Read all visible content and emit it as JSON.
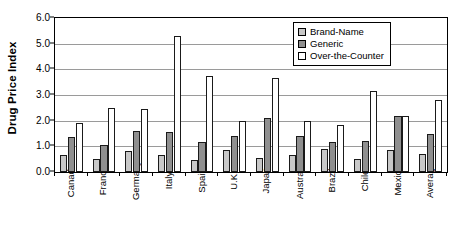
{
  "chart_data": {
    "type": "bar",
    "title": "",
    "xlabel": "",
    "ylabel": "Drug Price Index",
    "ylim": [
      0.0,
      6.0
    ],
    "ytick_labels": [
      "0.0",
      "1.0",
      "2.0",
      "3.0",
      "4.0",
      "5.0",
      "6.0"
    ],
    "ytick_values": [
      0.0,
      1.0,
      2.0,
      3.0,
      4.0,
      5.0,
      6.0
    ],
    "grid": true,
    "legend_position": "top-right",
    "categories": [
      "Canada",
      "France",
      "Germany",
      "Italy",
      "Spain",
      "U.K.",
      "Japan",
      "Australia",
      "Brazil",
      "Chile",
      "Mexico",
      "Average"
    ],
    "series": [
      {
        "name": "Brand-Name",
        "color": "#c8c8c8",
        "values": [
          0.65,
          0.5,
          0.8,
          0.65,
          0.45,
          0.85,
          0.55,
          0.65,
          0.9,
          0.5,
          0.85,
          0.7
        ]
      },
      {
        "name": "Generic",
        "color": "#8f8f8f",
        "values": [
          1.35,
          1.05,
          1.6,
          1.55,
          1.15,
          1.4,
          2.1,
          1.4,
          1.15,
          1.2,
          2.2,
          1.5
        ]
      },
      {
        "name": "Over-the-Counter",
        "color": "#ffffff",
        "values": [
          1.9,
          2.5,
          2.45,
          5.3,
          3.75,
          2.0,
          3.65,
          2.0,
          1.85,
          3.15,
          2.2,
          2.8
        ]
      }
    ]
  },
  "legend": {
    "items": [
      {
        "label": "Brand-Name",
        "swatch": "brand"
      },
      {
        "label": "Generic",
        "swatch": "generic"
      },
      {
        "label": "Over-the-Counter",
        "swatch": "otc"
      }
    ]
  }
}
